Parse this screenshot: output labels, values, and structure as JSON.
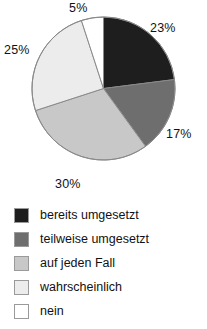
{
  "chart_data": {
    "type": "pie",
    "title": "",
    "subtitle": "",
    "xlabel": "",
    "ylabel": "",
    "grid": false,
    "legend_position": "bottom",
    "start_angle_deg": 0,
    "direction": "clockwise",
    "categories": [
      "bereits umgesetzt",
      "teilweise umgesetzt",
      "auf jeden Fall",
      "wahrscheinlich",
      "nein"
    ],
    "values": [
      23,
      17,
      30,
      25,
      5
    ],
    "data_labels": [
      "23%",
      "17%",
      "30%",
      "25%",
      "5%"
    ],
    "colors": [
      "#1e1e1e",
      "#6e6e6e",
      "#c8c8c8",
      "#ececec",
      "#ffffff"
    ],
    "slice_border_color": "#8a8a8a",
    "annotations": []
  },
  "pie": {
    "slices": [
      {
        "label": "bereits umgesetzt",
        "value": 23,
        "display": "23%",
        "color": "#1e1e1e"
      },
      {
        "label": "teilweise umgesetzt",
        "value": 17,
        "display": "17%",
        "color": "#6e6e6e"
      },
      {
        "label": "auf jeden Fall",
        "value": 30,
        "display": "30%",
        "color": "#c8c8c8"
      },
      {
        "label": "wahrscheinlich",
        "value": 25,
        "display": "25%",
        "color": "#ececec"
      },
      {
        "label": "nein",
        "value": 5,
        "display": "5%",
        "color": "#ffffff"
      }
    ]
  },
  "legend": {
    "items": [
      {
        "label": "bereits umgesetzt",
        "color": "#1e1e1e"
      },
      {
        "label": "teilweise umgesetzt",
        "color": "#6e6e6e"
      },
      {
        "label": "auf jeden Fall",
        "color": "#c8c8c8"
      },
      {
        "label": "wahrscheinlich",
        "color": "#ececec"
      },
      {
        "label": "nein",
        "color": "#ffffff"
      }
    ]
  }
}
